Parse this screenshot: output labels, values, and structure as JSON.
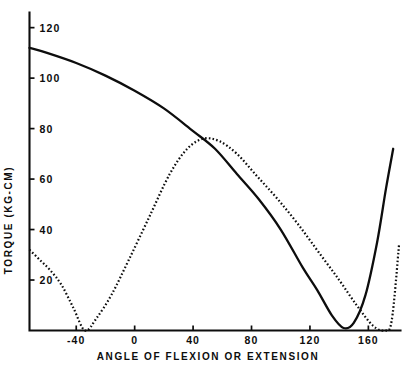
{
  "chart_data": {
    "type": "line",
    "title": "",
    "subtitle": "",
    "xlabel": "ANGLE OF FLEXION OR EXTENSION",
    "ylabel": "TORQUE (KG-CM)",
    "xlim": [
      -72,
      182
    ],
    "ylim": [
      0,
      126
    ],
    "grid": false,
    "legend": null,
    "xticks": [
      -40,
      0,
      40,
      80,
      120,
      160
    ],
    "xtick_labels": [
      "-40",
      "0",
      "40",
      "80",
      "120",
      "160"
    ],
    "yticks": [
      20,
      40,
      60,
      80,
      100,
      120
    ],
    "ytick_labels": [
      "20",
      "40",
      "60",
      "80",
      "100",
      "120"
    ],
    "series": [
      {
        "name": "solid-curve",
        "style": "solid",
        "x": [
          -72,
          -60,
          -40,
          -20,
          0,
          20,
          40,
          55,
          70,
          85,
          100,
          115,
          125,
          135,
          143,
          150,
          158,
          166,
          172,
          177
        ],
        "y": [
          112,
          110,
          106,
          101,
          95,
          88,
          79,
          72,
          62,
          52,
          40,
          25,
          16,
          6,
          1,
          3,
          14,
          35,
          56,
          72
        ]
      },
      {
        "name": "dotted-curve",
        "style": "dotted",
        "x": [
          -72,
          -65,
          -58,
          -50,
          -42,
          -34,
          -26,
          -16,
          -4,
          10,
          24,
          36,
          47,
          58,
          70,
          84,
          98,
          112,
          126,
          140,
          152,
          163,
          171,
          176,
          181
        ],
        "y": [
          32,
          28,
          24,
          18,
          9,
          0,
          5,
          14,
          28,
          45,
          62,
          72,
          76,
          75,
          70,
          61,
          52,
          42,
          31,
          20,
          10,
          2,
          0,
          4,
          34
        ]
      }
    ]
  },
  "axes": {
    "x_axis_name": "ANGLE OF FLEXION OR EXTENSION",
    "y_axis_name": "TORQUE (KG-CM)"
  }
}
